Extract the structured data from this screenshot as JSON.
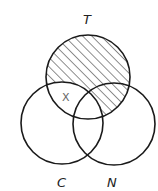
{
  "diagram": {
    "type": "venn",
    "sets": [
      {
        "id": "T",
        "label": "T",
        "cx": 88,
        "cy": 77,
        "r": 42
      },
      {
        "id": "C",
        "label": "C",
        "cx": 62,
        "cy": 123,
        "r": 41
      },
      {
        "id": "N",
        "label": "N",
        "cx": 114,
        "cy": 124,
        "r": 41
      }
    ],
    "shaded_region": "T minus C (hatched, includes T∩N outside C)",
    "marked_region": {
      "label": "X",
      "region": "T∩C only"
    },
    "colors": {
      "stroke": "#1a1a1a",
      "hatch": "#333333",
      "x_label": "#666666"
    }
  }
}
